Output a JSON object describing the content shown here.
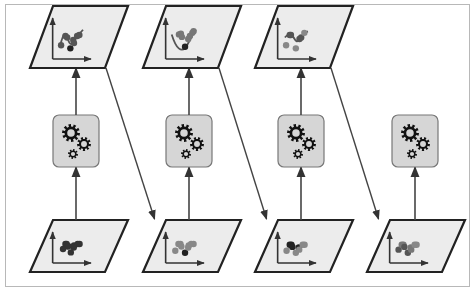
{
  "diagram": {
    "type": "boosting-sequence",
    "colors": {
      "panel_fill": "#ececec",
      "panel_stroke": "#222222",
      "gear_box_fill": "#d6d6d6",
      "gear_box_stroke": "#777777",
      "gear_color": "#111111",
      "arrow": "#444444",
      "frame": "#b8b8b8"
    },
    "stages": [
      {
        "input_points": [
          [
            0.18,
            0.62,
            "#333"
          ],
          [
            0.28,
            0.38,
            "#333"
          ],
          [
            0.33,
            0.38,
            "#333"
          ],
          [
            0.37,
            0.5,
            "#333"
          ],
          [
            0.5,
            0.78,
            "#333"
          ],
          [
            0.62,
            0.55,
            "#333"
          ],
          [
            0.63,
            0.45,
            "#333"
          ],
          [
            0.78,
            0.38,
            "#333"
          ],
          [
            0.86,
            0.38,
            "#333"
          ],
          [
            0.4,
            0.48,
            "#333"
          ]
        ],
        "has_output": true,
        "output_points": [
          [
            0.1,
            0.75,
            "#555"
          ],
          [
            0.28,
            0.45,
            "#555"
          ],
          [
            0.35,
            0.5,
            "#555"
          ],
          [
            0.48,
            0.85,
            "#222"
          ],
          [
            0.6,
            0.58,
            "#555"
          ],
          [
            0.63,
            0.68,
            "#555"
          ],
          [
            0.76,
            0.45,
            "#555"
          ],
          [
            0.85,
            0.42,
            "#555"
          ]
        ],
        "output_curve": "M0.05,0.8 C0.2,0.3 0.3,0.3 0.4,0.6 C0.5,0.8 0.6,0.7 0.7,0.5 C0.8,0.4 0.9,0.35 1,0.25"
      },
      {
        "input_points": [
          [
            0.15,
            0.7,
            "#888"
          ],
          [
            0.28,
            0.38,
            "#888"
          ],
          [
            0.36,
            0.38,
            "#888"
          ],
          [
            0.4,
            0.5,
            "#888"
          ],
          [
            0.55,
            0.8,
            "#222"
          ],
          [
            0.68,
            0.55,
            "#888"
          ],
          [
            0.7,
            0.45,
            "#888"
          ],
          [
            0.8,
            0.38,
            "#888"
          ],
          [
            0.9,
            0.38,
            "#888"
          ]
        ],
        "has_output": true,
        "output_points": [
          [
            0.3,
            0.4,
            "#777"
          ],
          [
            0.38,
            0.38,
            "#777"
          ],
          [
            0.42,
            0.48,
            "#777"
          ],
          [
            0.55,
            0.8,
            "#222"
          ],
          [
            0.68,
            0.55,
            "#777"
          ],
          [
            0.75,
            0.45,
            "#777"
          ],
          [
            0.85,
            0.35,
            "#777"
          ],
          [
            0.9,
            0.3,
            "#777"
          ]
        ],
        "output_curve": "M0,0.4 C0.2,0.9 0.4,0.95 0.55,0.85 C0.7,0.7 0.8,0.45 1,0.25"
      },
      {
        "input_points": [
          [
            0.12,
            0.7,
            "#888"
          ],
          [
            0.25,
            0.42,
            "#222"
          ],
          [
            0.32,
            0.42,
            "#222"
          ],
          [
            0.36,
            0.52,
            "#222"
          ],
          [
            0.5,
            0.8,
            "#888"
          ],
          [
            0.62,
            0.55,
            "#222"
          ],
          [
            0.64,
            0.65,
            "#888"
          ],
          [
            0.78,
            0.42,
            "#888"
          ],
          [
            0.86,
            0.42,
            "#888"
          ]
        ],
        "has_output": true,
        "output_points": [
          [
            0.1,
            0.75,
            "#888"
          ],
          [
            0.25,
            0.42,
            "#555"
          ],
          [
            0.3,
            0.42,
            "#555"
          ],
          [
            0.5,
            0.85,
            "#888"
          ],
          [
            0.65,
            0.55,
            "#555"
          ],
          [
            0.72,
            0.5,
            "#555"
          ],
          [
            0.85,
            0.35,
            "#888"
          ]
        ],
        "output_curve": "M0.05,0.5 C0.2,0.35 0.35,0.4 0.45,0.55 C0.55,0.7 0.65,0.6 0.75,0.45 C0.85,0.35 0.9,0.32 1,0.3"
      },
      {
        "input_points": [
          [
            0.12,
            0.65,
            "#555"
          ],
          [
            0.25,
            0.42,
            "#777"
          ],
          [
            0.32,
            0.42,
            "#777"
          ],
          [
            0.36,
            0.52,
            "#555"
          ],
          [
            0.5,
            0.8,
            "#555"
          ],
          [
            0.62,
            0.55,
            "#777"
          ],
          [
            0.64,
            0.65,
            "#777"
          ],
          [
            0.78,
            0.42,
            "#888"
          ],
          [
            0.86,
            0.42,
            "#888"
          ]
        ],
        "has_output": false
      }
    ]
  }
}
